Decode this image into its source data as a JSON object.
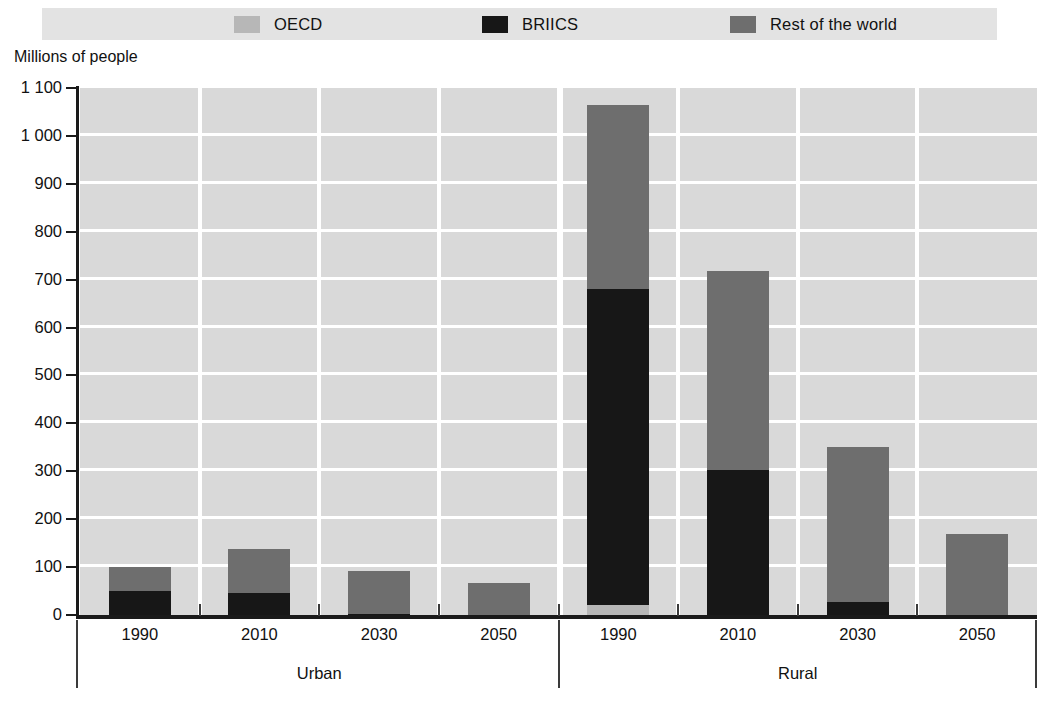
{
  "legend": {
    "position": "top",
    "items": [
      {
        "label": "OECD",
        "swatch": "legend-swatch-oecd",
        "color": "#b7b7b7"
      },
      {
        "label": "BRIICS",
        "swatch": "legend-swatch-briics",
        "color": "#171717"
      },
      {
        "label": "Rest of the world",
        "swatch": "legend-swatch-row",
        "color": "#6e6e6e"
      }
    ]
  },
  "axis": {
    "y_title": "Millions of people",
    "y_ticks": [
      "0",
      "100",
      "200",
      "300",
      "400",
      "500",
      "600",
      "700",
      "800",
      "900",
      "1 000",
      "1 100"
    ]
  },
  "groups": [
    {
      "name": "Urban"
    },
    {
      "name": "Rural"
    }
  ],
  "chart_data": {
    "type": "bar",
    "title": "",
    "subtitle": "",
    "xlabel": "",
    "ylabel": "Millions of people",
    "ylim": [
      0,
      1100
    ],
    "ytick_values": [
      0,
      100,
      200,
      300,
      400,
      500,
      600,
      700,
      800,
      900,
      1000,
      1100
    ],
    "grid": true,
    "stacked": true,
    "legend_position": "top",
    "group_labels": [
      "Urban",
      "Rural"
    ],
    "categories": [
      "1990",
      "2010",
      "2030",
      "2050",
      "1990",
      "2010",
      "2030",
      "2050"
    ],
    "series": [
      {
        "name": "OECD",
        "color": "#b7b7b7",
        "values": [
          0,
          0,
          0,
          0,
          20,
          0,
          0,
          0
        ]
      },
      {
        "name": "BRIICS",
        "color": "#171717",
        "values": [
          50,
          45,
          3,
          0,
          660,
          302,
          28,
          0
        ]
      },
      {
        "name": "Rest of the world",
        "color": "#6e6e6e",
        "values": [
          50,
          93,
          89,
          67,
          385,
          416,
          322,
          170
        ]
      }
    ],
    "totals": [
      100,
      138,
      92,
      67,
      1065,
      718,
      350,
      170
    ]
  }
}
